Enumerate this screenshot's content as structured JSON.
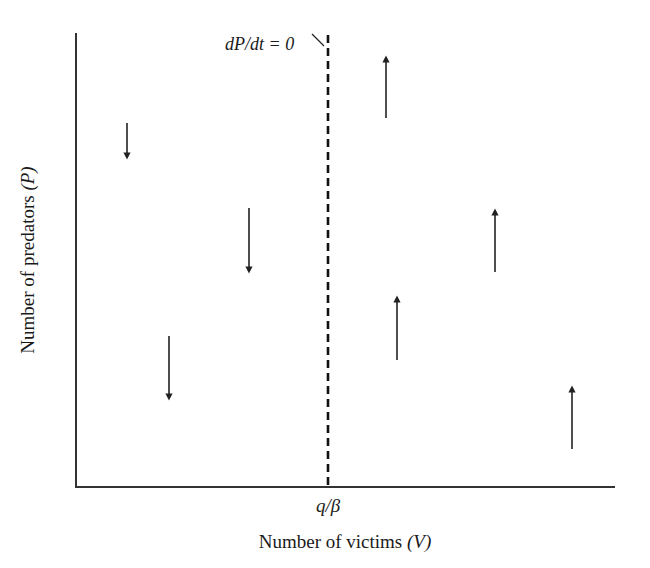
{
  "chart_data": {
    "type": "diagram",
    "title": "",
    "xlabel": "Number of victims (V)",
    "ylabel": "Number of predators (P)",
    "xlabel_parts": {
      "text": "Number of victims ",
      "var": "(V)"
    },
    "ylabel_parts": {
      "text": "Number of predators ",
      "var": "(P)"
    },
    "x_tick_label": "q/β",
    "isocline": {
      "label": "dP/dt = 0",
      "style": "dashed",
      "position": "x = q/β",
      "description": "Vertical predator zero-growth isocline"
    },
    "regions": [
      {
        "side": "left of isocline (V < q/β)",
        "direction": "down",
        "meaning": "predators decrease"
      },
      {
        "side": "right of isocline (V > q/β)",
        "direction": "up",
        "meaning": "predators increase"
      }
    ],
    "arrows": [
      {
        "x": 127,
        "y_start": 123,
        "y_end": 160,
        "direction": "down"
      },
      {
        "x": 249,
        "y_start": 208,
        "y_end": 274,
        "direction": "down"
      },
      {
        "x": 169,
        "y_start": 336,
        "y_end": 401,
        "direction": "down"
      },
      {
        "x": 386,
        "y_start": 118,
        "y_end": 55,
        "direction": "up"
      },
      {
        "x": 495,
        "y_start": 272,
        "y_end": 208,
        "direction": "up"
      },
      {
        "x": 397,
        "y_start": 360,
        "y_end": 295,
        "direction": "up"
      },
      {
        "x": 572,
        "y_start": 449,
        "y_end": 385,
        "direction": "up"
      }
    ],
    "grid": false,
    "legend": null
  },
  "colors": {
    "axis": "#333333",
    "arrow": "#222222",
    "isocline": "#111111",
    "background": "#ffffff"
  }
}
